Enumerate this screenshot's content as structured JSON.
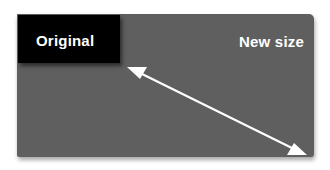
{
  "diagram": {
    "original": {
      "label": "Original",
      "fill": "#000000"
    },
    "new_size": {
      "label": "New size",
      "fill": "#5f5f5f"
    },
    "arrow": {
      "type": "double-headed",
      "color": "#ffffff",
      "from": [
        127,
        67
      ],
      "to": [
        307,
        155
      ]
    }
  }
}
